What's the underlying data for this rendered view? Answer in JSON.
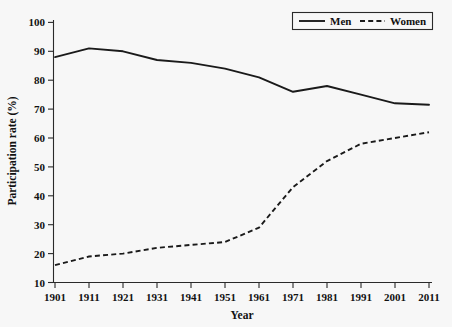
{
  "chart_data": {
    "type": "line",
    "title": "",
    "xlabel": "Year",
    "ylabel": "Participation rate (%)",
    "x": [
      1901,
      1911,
      1921,
      1931,
      1941,
      1951,
      1961,
      1971,
      1981,
      1991,
      2001,
      2011
    ],
    "xtick_labels": [
      "1901",
      "1911",
      "1921",
      "1931",
      "1941",
      "1951",
      "1961",
      "1971",
      "1981",
      "1991",
      "2001",
      "2011"
    ],
    "ytick_labels": [
      "10",
      "20",
      "30",
      "40",
      "50",
      "60",
      "70",
      "80",
      "90",
      "100"
    ],
    "yticks": [
      10,
      20,
      30,
      40,
      50,
      60,
      70,
      80,
      90,
      100
    ],
    "xlim": [
      1901,
      2011
    ],
    "ylim": [
      10,
      100
    ],
    "grid": false,
    "legend_position": "top-right",
    "series": [
      {
        "name": "Men",
        "style": "solid",
        "color": "#1a1a1a",
        "values": [
          88,
          91,
          90,
          87,
          86,
          84,
          81,
          76,
          78,
          75,
          72,
          71.5
        ]
      },
      {
        "name": "Women",
        "style": "dashed",
        "color": "#1a1a1a",
        "values": [
          16,
          19,
          20,
          22,
          23,
          24,
          29,
          43,
          52,
          58,
          60,
          62
        ]
      }
    ]
  },
  "legend": {
    "men_label": "Men",
    "women_label": "Women"
  },
  "axes": {
    "x_title": "Year",
    "y_title": "Participation rate (%)"
  }
}
